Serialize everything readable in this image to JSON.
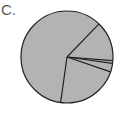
{
  "label": "C.",
  "chart_data": {
    "type": "pie",
    "title": "",
    "slices": [
      {
        "label": "",
        "percent": 60
      },
      {
        "label": "",
        "percent": 14
      },
      {
        "label": "",
        "percent": 1
      },
      {
        "label": "",
        "percent": 3
      },
      {
        "label": "",
        "percent": 22
      }
    ],
    "start_angle_deg_clockwise_from_north": 44,
    "fill_color": "#b3b3b3",
    "stroke_color": "#222222",
    "legend": false
  }
}
